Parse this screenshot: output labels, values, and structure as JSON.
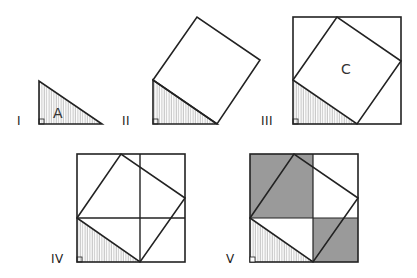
{
  "figure": {
    "stroke_color": "#222222",
    "shade_color": "#9a9a9a",
    "hatch_color": "#999999",
    "panels": [
      {
        "id": "I",
        "label": "I",
        "area_label": "A"
      },
      {
        "id": "II",
        "label": "II"
      },
      {
        "id": "III",
        "label": "III",
        "area_label": "C"
      },
      {
        "id": "IV",
        "label": "IV"
      },
      {
        "id": "V",
        "label": "V"
      }
    ]
  }
}
